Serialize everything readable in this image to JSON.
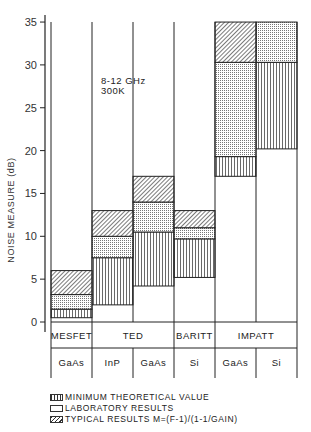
{
  "chart_data": {
    "type": "bar",
    "subtype": "stacked-range",
    "title": "",
    "annotation": [
      "8-12 GHz",
      "300K"
    ],
    "ylabel": "NOISE MEASURE (dB)",
    "xlabel": "",
    "ylim": [
      0,
      35
    ],
    "yticks": [
      0,
      5,
      10,
      15,
      20,
      25,
      30,
      35
    ],
    "grid": false,
    "legend_position": "bottom",
    "groups": [
      {
        "label": "MESFET",
        "span": 1
      },
      {
        "label": "TED",
        "span": 2
      },
      {
        "label": "BARITT",
        "span": 1
      },
      {
        "label": "IMPATT",
        "span": 2
      }
    ],
    "categories": [
      "GaAs",
      "InP",
      "GaAs",
      "Si",
      "GaAs",
      "Si"
    ],
    "series": [
      {
        "name": "MINIMUM THEORETICAL VALUE",
        "pattern": "vertical-lines",
        "ranges": [
          [
            0.5,
            1.5
          ],
          [
            2,
            7.5
          ],
          [
            4.2,
            10.5
          ],
          [
            5.2,
            9.7
          ],
          [
            17,
            19.3
          ],
          [
            20.2,
            30.3
          ]
        ]
      },
      {
        "name": "LABORATORY RESULTS",
        "pattern": "dots",
        "ranges": [
          [
            1.5,
            3.2
          ],
          [
            7.5,
            10
          ],
          [
            10.5,
            14
          ],
          [
            9.7,
            11
          ],
          [
            19.3,
            30.3
          ],
          [
            30.3,
            35
          ]
        ]
      },
      {
        "name": "TYPICAL RESULTS M=(F-1)/(1-1/GAIN)",
        "pattern": "diagonal-hatch",
        "ranges": [
          [
            3.2,
            6
          ],
          [
            10,
            13
          ],
          [
            14,
            17
          ],
          [
            11,
            13
          ],
          [
            30.3,
            35
          ],
          null
        ]
      }
    ]
  },
  "axis": {
    "ticks": [
      "0",
      "5",
      "10",
      "15",
      "20",
      "25",
      "30",
      "35"
    ],
    "label": "NOISE MEASURE (dB)"
  },
  "annotation": {
    "line1": "8-12 GHz",
    "line2": "300K"
  },
  "groups": [
    "MESFET",
    "TED",
    "BARITT",
    "IMPATT"
  ],
  "materials": [
    "GaAs",
    "InP",
    "GaAs",
    "Si",
    "GaAs",
    "Si"
  ],
  "legend": {
    "min": "MINIMUM THEORETICAL VALUE",
    "lab": "LABORATORY RESULTS",
    "typ": "TYPICAL RESULTS M=(F-1)/(1-1/GAIN)"
  }
}
